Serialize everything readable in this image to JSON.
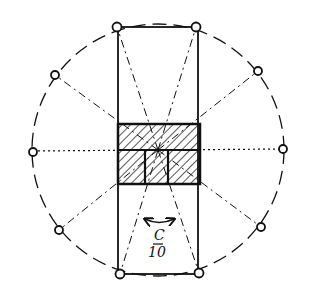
{
  "diagram": {
    "type": "plan-sketch",
    "center": [
      158,
      150
    ],
    "circle_radius": 126,
    "stroke_color": "#111111",
    "background": "#ffffff",
    "points": [
      {
        "id": "p1",
        "x": 117,
        "y": 27
      },
      {
        "id": "p2",
        "x": 196,
        "y": 27
      },
      {
        "id": "p3",
        "x": 258,
        "y": 71
      },
      {
        "id": "p4",
        "x": 283,
        "y": 149
      },
      {
        "id": "p5",
        "x": 261,
        "y": 227
      },
      {
        "id": "p6",
        "x": 199,
        "y": 273
      },
      {
        "id": "p7",
        "x": 120,
        "y": 274
      },
      {
        "id": "p8",
        "x": 59,
        "y": 230
      },
      {
        "id": "p9",
        "x": 33,
        "y": 152
      },
      {
        "id": "p10",
        "x": 55,
        "y": 75
      }
    ],
    "outer_rectangle": {
      "x": 118,
      "y": 27,
      "w": 80,
      "h": 247
    },
    "central_block": {
      "x": 118,
      "y": 124,
      "w": 82,
      "h": 60,
      "split_y": 150,
      "lower_dividers_x": [
        145,
        168
      ]
    },
    "rotation_arrow": {
      "label": "C",
      "sublabel": "10"
    }
  }
}
